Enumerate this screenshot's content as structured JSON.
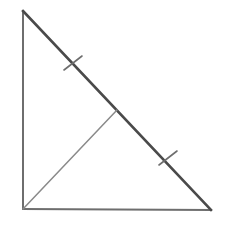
{
  "canvas": {
    "width": 226,
    "height": 235,
    "background_color": "#ffffff"
  },
  "figure": {
    "name": "right-triangle-with-median"
  },
  "style": {
    "hypotenuse_color": "#4a4a4a",
    "hypotenuse_width": 2.6,
    "leg_color": "#6e6e6e",
    "leg_width": 2.0,
    "median_color": "#8a8a8a",
    "median_width": 1.5,
    "tick_color": "#6e6e6e",
    "tick_width": 1.6
  },
  "vertices": {
    "top": {
      "label": "A",
      "x": 23,
      "y": 11
    },
    "bottom_left": {
      "label": "C",
      "x": 23,
      "y": 209
    },
    "bottom_right": {
      "label": "B",
      "x": 211,
      "y": 210
    },
    "hypotenuse_midpoint": {
      "label": "M",
      "x": 117,
      "y": 110
    }
  },
  "segments": [
    {
      "name": "vertical-leg",
      "from": "top",
      "to": "bottom_left",
      "x1": 23,
      "y1": 11,
      "x2": 23,
      "y2": 209,
      "color": "#6e6e6e",
      "width": 2.0
    },
    {
      "name": "horizontal-leg",
      "from": "bottom_left",
      "to": "bottom_right",
      "x1": 23,
      "y1": 209,
      "x2": 211,
      "y2": 210,
      "color": "#6e6e6e",
      "width": 2.0
    },
    {
      "name": "hypotenuse",
      "from": "top",
      "to": "bottom_right",
      "x1": 23,
      "y1": 11,
      "x2": 211,
      "y2": 210,
      "color": "#4a4a4a",
      "width": 2.6
    },
    {
      "name": "median",
      "from": "bottom_left",
      "to": "hypotenuse_midpoint",
      "x1": 23,
      "y1": 209,
      "x2": 117,
      "y2": 110,
      "color": "#8a8a8a",
      "width": 1.5
    }
  ],
  "tick_marks": [
    {
      "name": "upper-hypotenuse-tick",
      "on_segment": "hypotenuse",
      "center_x": 73,
      "center_y": 63,
      "x1": 64,
      "y1": 70,
      "x2": 82,
      "y2": 56,
      "color": "#6e6e6e",
      "width": 1.6
    },
    {
      "name": "lower-hypotenuse-tick",
      "on_segment": "hypotenuse",
      "center_x": 168,
      "center_y": 158,
      "x1": 159,
      "y1": 165,
      "x2": 177,
      "y2": 151,
      "color": "#6e6e6e",
      "width": 1.6
    }
  ]
}
